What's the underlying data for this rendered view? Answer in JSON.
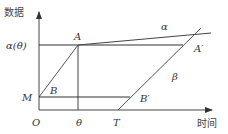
{
  "diagram": {
    "axes": {
      "y_label": "数据",
      "x_label": "时间",
      "origin_label": "O"
    },
    "y_ticks": [
      {
        "label": "α(θ)",
        "y": 45
      },
      {
        "label": "M",
        "y": 97
      }
    ],
    "x_ticks": [
      {
        "label": "θ",
        "x": 78
      },
      {
        "label": "T",
        "x": 118
      }
    ],
    "points": {
      "A": "A",
      "A_prime": "A′",
      "B": "B",
      "B_prime": "B′"
    },
    "lines": {
      "alpha": "α",
      "beta": "β"
    },
    "colors": {
      "axis": "#444444",
      "line": "#555555",
      "text": "#333333"
    }
  }
}
